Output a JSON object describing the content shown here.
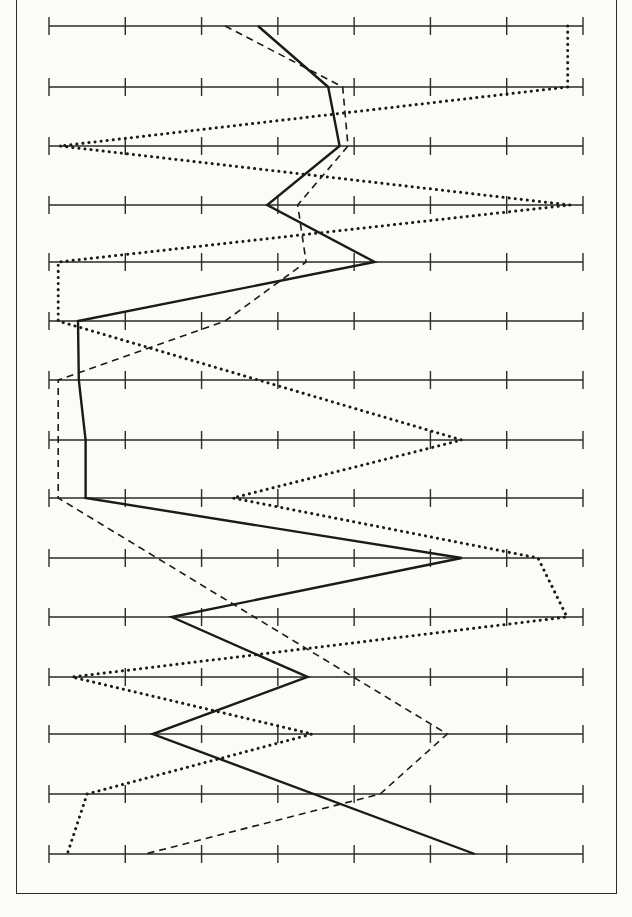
{
  "chart_data": {
    "type": "line",
    "orientation": "horizontal-profile",
    "title": "",
    "xlabel": "",
    "ylabel": "",
    "grid": false,
    "legend": null,
    "axis_count": 15,
    "scale": {
      "min": 0,
      "max": 7,
      "ticks": [
        0,
        1,
        2,
        3,
        4,
        5,
        6,
        7
      ]
    },
    "rows": [
      1,
      2,
      3,
      4,
      5,
      6,
      7,
      8,
      9,
      10,
      11,
      12,
      13,
      14,
      15
    ],
    "series": [
      {
        "name": "solid",
        "style": "solid",
        "color": "#1a1a1a",
        "vertices": [
          {
            "row": 1,
            "value": 2.74
          },
          {
            "row": 2,
            "value": 3.66
          },
          {
            "row": 3,
            "value": 3.81
          },
          {
            "row": 4,
            "value": 2.86
          },
          {
            "row": 5,
            "value": 4.27
          },
          {
            "row": 6,
            "value": 0.38
          },
          {
            "row": 7,
            "value": 0.39
          },
          {
            "row": 8,
            "value": 0.48
          },
          {
            "row": 9,
            "value": 0.48
          },
          {
            "row": 10,
            "value": 5.41
          },
          {
            "row": 11,
            "value": 1.61
          },
          {
            "row": 12,
            "value": 3.39
          },
          {
            "row": 13,
            "value": 1.36
          },
          {
            "row": 15,
            "value": 5.58
          }
        ]
      },
      {
        "name": "dashed",
        "style": "dashed",
        "color": "#1a1a1a",
        "vertices": [
          {
            "row": 1,
            "value": 2.31
          },
          {
            "row": 2,
            "value": 3.85
          },
          {
            "row": 3,
            "value": 3.92
          },
          {
            "row": 4,
            "value": 3.26
          },
          {
            "row": 5,
            "value": 3.37
          },
          {
            "row": 6,
            "value": 2.31
          },
          {
            "row": 7,
            "value": 0.12
          },
          {
            "row": 8,
            "value": 0.12
          },
          {
            "row": 9,
            "value": 0.12
          },
          {
            "row": 13,
            "value": 5.22
          },
          {
            "row": 14,
            "value": 4.34
          },
          {
            "row": 15,
            "value": 1.26
          }
        ]
      },
      {
        "name": "dotted",
        "style": "dotted",
        "color": "#1a1a1a",
        "vertices": [
          {
            "row": 1,
            "value": 6.8
          },
          {
            "row": 2,
            "value": 6.8
          },
          {
            "row": 3,
            "value": 0.14
          },
          {
            "row": 4,
            "value": 6.83
          },
          {
            "row": 5,
            "value": 0.12
          },
          {
            "row": 6,
            "value": 0.12
          },
          {
            "row": 8,
            "value": 5.41
          },
          {
            "row": 9,
            "value": 2.41
          },
          {
            "row": 10,
            "value": 6.41
          },
          {
            "row": 11,
            "value": 6.79
          },
          {
            "row": 12,
            "value": 0.3
          },
          {
            "row": 13,
            "value": 3.45
          },
          {
            "row": 14,
            "value": 0.5
          },
          {
            "row": 15,
            "value": 0.24
          }
        ]
      }
    ]
  },
  "layout": {
    "axis_x_start": 49,
    "axis_x_end": 583,
    "axis_y": [
      26,
      87,
      146,
      205,
      262,
      321,
      380,
      440,
      498,
      558,
      617,
      677,
      734,
      794,
      854
    ],
    "tick_half_height": 9
  }
}
